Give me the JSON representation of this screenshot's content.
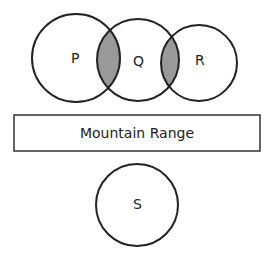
{
  "diagram": {
    "circles": [
      {
        "id": "P",
        "label": "P",
        "cx": 76,
        "cy": 58,
        "r": 44
      },
      {
        "id": "Q",
        "label": "Q",
        "cx": 138,
        "cy": 60,
        "r": 41
      },
      {
        "id": "R",
        "label": "R",
        "cx": 199,
        "cy": 63,
        "r": 38
      },
      {
        "id": "S",
        "label": "S",
        "cx": 137,
        "cy": 205,
        "r": 41
      }
    ],
    "shaded_regions": [
      "P∩Q",
      "Q∩R"
    ],
    "shade_color": "#999999",
    "box": {
      "label": "Mountain Range"
    }
  }
}
